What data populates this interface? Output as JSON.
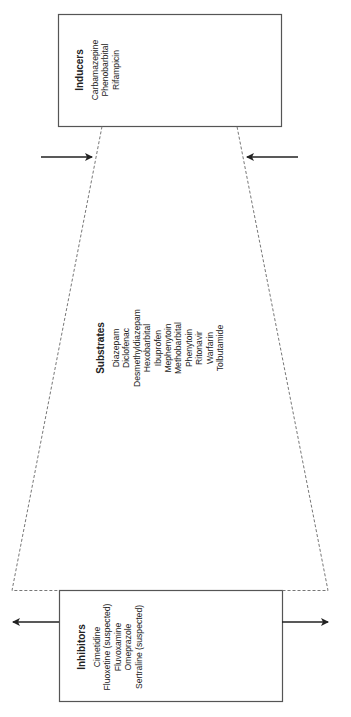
{
  "diagram": {
    "orientation": "rotated -90deg (text reads bottom-to-top)",
    "inducers": {
      "title": "Inducers",
      "items": [
        "Carbamazepine",
        "Phenobarbital",
        "Rifampicin"
      ]
    },
    "substrates": {
      "title": "Substrates",
      "items": [
        "Diazepam",
        "Diclofenac",
        "Desmethyldiazepam",
        "Hexobarbital",
        "Ibuprofen",
        "Mephenytoin",
        "Methobarbital",
        "Phenytoin",
        "Ritonavir",
        "Warfarin",
        "Tolbutamide"
      ]
    },
    "inhibitors": {
      "title": "Inhibitors",
      "items": [
        "Cimetidine",
        "Fluoxetine (suspected)",
        "Fluvoxamine",
        "Omeprazole",
        "Sertraline (suspected)"
      ]
    },
    "colors": {
      "box_border": "#555555",
      "dashed_line": "#777777",
      "arrow": "#222222",
      "text": "#222222"
    }
  }
}
